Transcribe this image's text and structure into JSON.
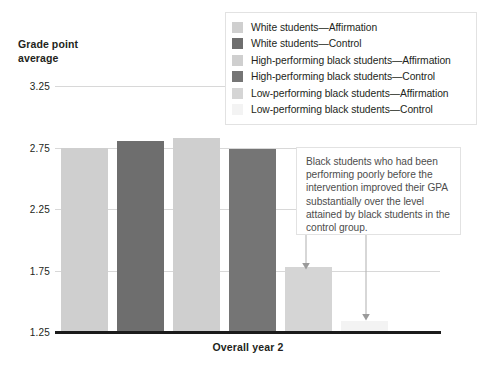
{
  "chart_data": {
    "type": "bar",
    "title": "",
    "ylabel": "Grade point average",
    "xlabel": "Overall year 2",
    "categories": [
      "Overall year 2"
    ],
    "ylim": [
      1.25,
      3.25
    ],
    "yticks": [
      "3.25",
      "2.75",
      "2.25",
      "1.75",
      "1.25"
    ],
    "ytick_values": [
      3.25,
      2.75,
      2.25,
      1.75,
      1.25
    ],
    "grid": true,
    "legend_position": "top-right",
    "series": [
      {
        "name": "White students—Affirmation",
        "value": 2.75,
        "color": "#cfcfcf"
      },
      {
        "name": "White students—Control",
        "value": 2.8,
        "color": "#6e6e6e"
      },
      {
        "name": "High-performing black students—Affirmation",
        "value": 2.83,
        "color": "#cfcfcf"
      },
      {
        "name": "High-performing black students—Control",
        "value": 2.74,
        "color": "#757575"
      },
      {
        "name": "Low-performing black students—Affirmation",
        "value": 1.78,
        "color": "#d5d5d5"
      },
      {
        "name": "Low-performing black students—Control",
        "value": 1.34,
        "color": "#f3f3f3"
      }
    ],
    "annotations": [
      {
        "text": "Black students who had been performing poorly before the intervention improved their GPA substantially over the level attained by black students in the control group.",
        "points_to": [
          "Low-performing black students—Affirmation",
          "Low-performing black students—Control"
        ]
      }
    ]
  },
  "axis": {
    "y_title_line1": "Grade point",
    "y_title_line2": "average",
    "x_label": "Overall year 2",
    "ticks": [
      "3.25",
      "2.75",
      "2.25",
      "1.75",
      "1.25"
    ]
  },
  "legend": {
    "items": [
      {
        "label": "White students—Affirmation",
        "color": "#cfcfcf"
      },
      {
        "label": "White students—Control",
        "color": "#6e6e6e"
      },
      {
        "label": "High-performing black students—Affirmation",
        "color": "#cfcfcf"
      },
      {
        "label": "High-performing black students—Control",
        "color": "#757575"
      },
      {
        "label": "Low-performing black students—Affirmation",
        "color": "#d5d5d5"
      },
      {
        "label": "Low-performing black students—Control",
        "color": "#f3f3f3"
      }
    ]
  },
  "annotation": {
    "text": "Black students who had been performing poorly before the intervention improved their GPA substantially over the level attained by black students in the control group."
  }
}
